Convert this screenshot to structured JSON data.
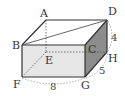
{
  "figure": {
    "type": "rectangular-prism",
    "vertices": {
      "A": {
        "label": "A"
      },
      "B": {
        "label": "B"
      },
      "C": {
        "label": "C"
      },
      "D": {
        "label": "D"
      },
      "E": {
        "label": "E"
      },
      "F": {
        "label": "F"
      },
      "G": {
        "label": "G"
      },
      "H": {
        "label": "H"
      }
    },
    "dimensions": {
      "FG": "8",
      "GH": "5",
      "DH": "4"
    },
    "segments": [
      "BD"
    ],
    "colors": {
      "front_face": "#e8e8e8",
      "side_face": "#8a8a8a",
      "top_face": "#ffffff",
      "edge": "#333333",
      "hidden_edge": "#666666",
      "dimension_arc": "#888888"
    }
  }
}
